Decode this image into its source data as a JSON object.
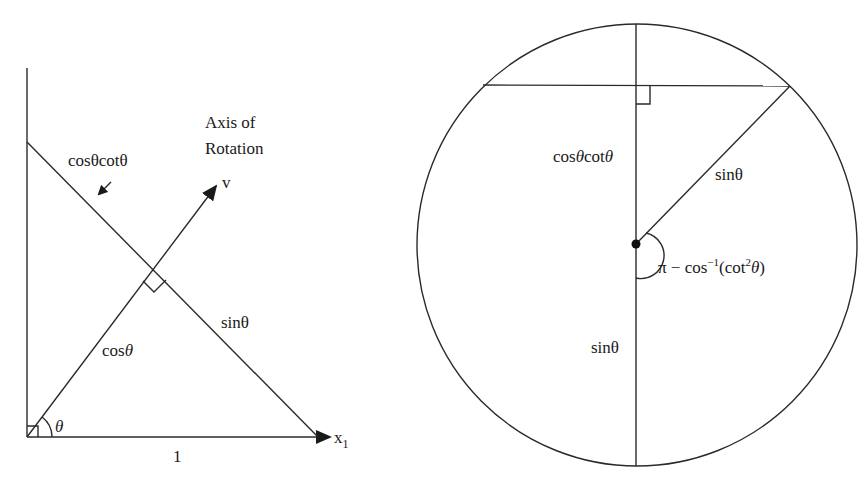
{
  "left_figure": {
    "labels": {
      "axis_title_line1": "Axis of",
      "axis_title_line2": "Rotation",
      "v": "v",
      "cos_cot": "cosθcotθ",
      "cos": "cos",
      "cos_theta": "θ",
      "sin": "sinθ",
      "theta": "θ",
      "x": "x",
      "x_sub": "1",
      "one": "1"
    }
  },
  "right_figure": {
    "labels": {
      "cos": "cos",
      "cos_theta1": "θ",
      "cot": "cot",
      "cos_theta2": "θ",
      "sin_radius": "sinθ",
      "sin_lower": "sinθ",
      "angle_pi": "π − cos",
      "angle_sup": "−1",
      "angle_open": "(cot",
      "angle_sup2": "2",
      "angle_theta": "θ",
      "angle_close": ")"
    }
  },
  "colors": {
    "line": "#2a2a2a",
    "text": "#1a1a1a",
    "background": "#ffffff"
  }
}
